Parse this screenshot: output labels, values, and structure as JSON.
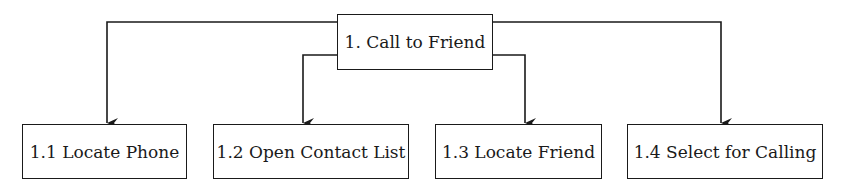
{
  "diagram": {
    "type": "hierarchy",
    "root": {
      "label": "1. Call to Friend"
    },
    "children": [
      {
        "label": "1.1 Locate Phone"
      },
      {
        "label": "1.2 Open Contact List"
      },
      {
        "label": "1.3 Locate Friend"
      },
      {
        "label": "1.4 Select for Calling"
      }
    ],
    "colors": {
      "stroke": "#1a1a1a",
      "background": "#ffffff"
    }
  }
}
